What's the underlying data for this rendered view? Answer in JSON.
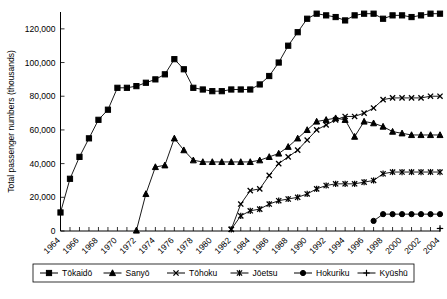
{
  "chart_data": {
    "type": "line",
    "title": "",
    "xlabel": "",
    "ylabel": "Total passenger numbers (thousands)",
    "ylim": [
      0,
      130000
    ],
    "yticks": [
      0,
      20000,
      40000,
      60000,
      80000,
      100000,
      120000
    ],
    "ytick_labels": [
      "0",
      "20,000",
      "40,000",
      "60,000",
      "80,000",
      "100,000",
      "120,000"
    ],
    "xlim": [
      1964,
      2004
    ],
    "xticks": [
      1964,
      1965,
      1966,
      1967,
      1968,
      1969,
      1970,
      1971,
      1972,
      1973,
      1974,
      1975,
      1976,
      1977,
      1978,
      1979,
      1980,
      1981,
      1982,
      1983,
      1984,
      1985,
      1986,
      1987,
      1988,
      1989,
      1990,
      1991,
      1992,
      1993,
      1994,
      1995,
      1996,
      1997,
      1998,
      1999,
      2000,
      2001,
      2002,
      2003,
      2004
    ],
    "xtick_labels": [
      "1964",
      "1966",
      "1968",
      "1970",
      "1972",
      "1974",
      "1976",
      "1978",
      "1980",
      "1982",
      "1984",
      "1986",
      "1988",
      "1990",
      "1992",
      "1994",
      "1996",
      "1998",
      "2000",
      "2002",
      "2004"
    ],
    "xtick_label_years": [
      1964,
      1966,
      1968,
      1970,
      1972,
      1974,
      1976,
      1978,
      1980,
      1982,
      1984,
      1986,
      1988,
      1990,
      1992,
      1994,
      1996,
      1998,
      2000,
      2002,
      2004
    ],
    "grid": false,
    "legend_position": "bottom",
    "series": [
      {
        "name": "Tōkaidō",
        "marker": "square",
        "x": [
          1964,
          1965,
          1966,
          1967,
          1968,
          1969,
          1970,
          1971,
          1972,
          1973,
          1974,
          1975,
          1976,
          1977,
          1978,
          1979,
          1980,
          1981,
          1982,
          1983,
          1984,
          1985,
          1986,
          1987,
          1988,
          1989,
          1990,
          1991,
          1992,
          1993,
          1994,
          1995,
          1996,
          1997,
          1998,
          1999,
          2000,
          2001,
          2002,
          2003,
          2004
        ],
        "values": [
          11000,
          31000,
          44000,
          55000,
          66000,
          72000,
          85000,
          85000,
          86000,
          88000,
          90000,
          93000,
          102000,
          96000,
          85000,
          84000,
          83000,
          83000,
          84000,
          84000,
          84000,
          87000,
          92000,
          100000,
          110000,
          118000,
          126000,
          129000,
          128000,
          127000,
          125000,
          128000,
          129000,
          129000,
          126000,
          128000,
          128000,
          127000,
          128000,
          129000,
          129000
        ]
      },
      {
        "name": "Sanyō",
        "marker": "triangle",
        "x": [
          1972,
          1973,
          1974,
          1975,
          1976,
          1977,
          1978,
          1979,
          1980,
          1981,
          1982,
          1983,
          1984,
          1985,
          1986,
          1987,
          1988,
          1989,
          1990,
          1991,
          1992,
          1993,
          1994,
          1995,
          1996,
          1997,
          1998,
          1999,
          2000,
          2001,
          2002,
          2003,
          2004
        ],
        "values": [
          300,
          22000,
          38000,
          39000,
          55000,
          48000,
          42000,
          41000,
          41000,
          41000,
          41000,
          41000,
          41000,
          42000,
          44000,
          46000,
          50000,
          55000,
          60000,
          65000,
          66000,
          67000,
          66000,
          56000,
          65000,
          64000,
          62000,
          59000,
          58000,
          57000,
          57000,
          57000,
          57000
        ]
      },
      {
        "name": "Tōhoku",
        "marker": "cross-x",
        "x": [
          1982,
          1983,
          1984,
          1985,
          1986,
          1987,
          1988,
          1989,
          1990,
          1991,
          1992,
          1993,
          1994,
          1995,
          1996,
          1997,
          1998,
          1999,
          2000,
          2001,
          2002,
          2003,
          2004
        ],
        "values": [
          1000,
          16000,
          24000,
          25000,
          33000,
          40000,
          44000,
          48000,
          54000,
          60000,
          63000,
          66000,
          68000,
          68000,
          70000,
          73000,
          78000,
          79000,
          79000,
          79000,
          79000,
          80000,
          80000
        ]
      },
      {
        "name": "Jōetsu",
        "marker": "asterisk",
        "x": [
          1982,
          1983,
          1984,
          1985,
          1986,
          1987,
          1988,
          1989,
          1990,
          1991,
          1992,
          1993,
          1994,
          1995,
          1996,
          1997,
          1998,
          1999,
          2000,
          2001,
          2002,
          2003,
          2004
        ],
        "values": [
          1000,
          9000,
          12000,
          13000,
          16000,
          18000,
          19000,
          20000,
          22000,
          25000,
          27000,
          28000,
          28000,
          28000,
          29000,
          30000,
          34000,
          35000,
          35000,
          35000,
          35000,
          35000,
          35000
        ]
      },
      {
        "name": "Hokuriku",
        "marker": "circle",
        "x": [
          1997,
          1998,
          1999,
          2000,
          2001,
          2002,
          2003,
          2004
        ],
        "values": [
          6000,
          10000,
          10000,
          10000,
          10000,
          10000,
          10000,
          10000
        ]
      },
      {
        "name": "Kyūshū",
        "marker": "plus",
        "x": [
          2004
        ],
        "values": [
          1500
        ]
      }
    ]
  },
  "legend": {
    "items": [
      {
        "label": "Tōkaidō",
        "marker": "square"
      },
      {
        "label": "Sanyō",
        "marker": "triangle"
      },
      {
        "label": "Tōhoku",
        "marker": "cross-x"
      },
      {
        "label": "Jōetsu",
        "marker": "asterisk"
      },
      {
        "label": "Hokuriku",
        "marker": "circle"
      },
      {
        "label": "Kyūshū",
        "marker": "plus"
      }
    ]
  },
  "colors": {
    "line": "#000000",
    "background": "#ffffff",
    "axis": "#000000"
  }
}
